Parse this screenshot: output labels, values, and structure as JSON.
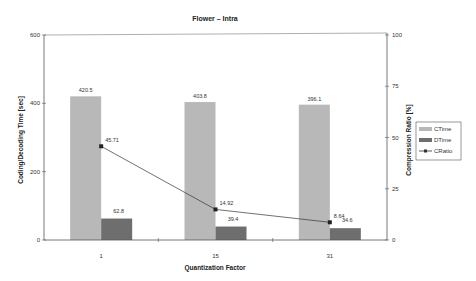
{
  "chart_data": {
    "type": "bar",
    "title": "Flower – Intra",
    "xlabel": "Quantization Factor",
    "ylabel": "Coding/Decoding Time [sec]",
    "y2label": "Compression Ratio [%]",
    "categories": [
      "1",
      "15",
      "31"
    ],
    "ylim": [
      0,
      600
    ],
    "y2lim": [
      0,
      100
    ],
    "yticks": [
      "0",
      "200",
      "400",
      "600"
    ],
    "y2ticks": [
      "0",
      "25",
      "50",
      "75",
      "100"
    ],
    "grid": false,
    "legend_position": "right",
    "series": [
      {
        "name": "CTime",
        "type": "bar",
        "axis": "left",
        "color": "#b8b8b8",
        "values": [
          420.5,
          403.8,
          396.1
        ],
        "labels": [
          "420.5",
          "403.8",
          "396.1"
        ]
      },
      {
        "name": "DTime",
        "type": "bar",
        "axis": "left",
        "color": "#6e6e6e",
        "values": [
          62.8,
          39.4,
          34.6
        ],
        "labels": [
          "62.8",
          "39.4",
          "34.6"
        ]
      },
      {
        "name": "CRatio",
        "type": "line",
        "axis": "right",
        "color": "#333333",
        "values": [
          45.71,
          14.92,
          8.64
        ],
        "labels": [
          "45.71",
          "14.92",
          "8.64"
        ]
      }
    ]
  }
}
